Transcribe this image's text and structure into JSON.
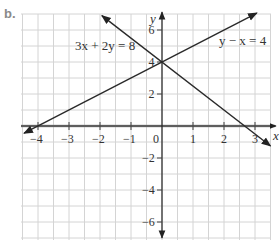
{
  "part_label": "b.",
  "chart_data": {
    "type": "line",
    "title": "",
    "xlabel": "x",
    "ylabel": "y",
    "xlim": [
      -4.5,
      3.5
    ],
    "ylim": [
      -7,
      7
    ],
    "grid": true,
    "x_ticks": [
      -4,
      -3,
      -2,
      -1,
      0,
      1,
      2,
      3
    ],
    "x_tick_labels": [
      "−4",
      "−3",
      "−2",
      "−1",
      "0",
      "1",
      "2",
      "3"
    ],
    "y_ticks": [
      6,
      4,
      2,
      -2,
      -4,
      -6
    ],
    "y_tick_labels": [
      "6",
      "4",
      "2",
      "−2",
      "−4",
      "−6"
    ],
    "series": [
      {
        "name": "3x + 2y = 8",
        "equation": "y = 4 - 1.5x",
        "x": [
          -1.94,
          0,
          2.667,
          3.5
        ],
        "y": [
          6.9,
          4,
          0,
          -1.25
        ]
      },
      {
        "name": "y − x = 4",
        "equation": "y = x + 4",
        "x": [
          -4.45,
          -4,
          0,
          3.06
        ],
        "y": [
          -0.45,
          0,
          4,
          7.06
        ]
      }
    ],
    "annotations": [
      {
        "text": "3x + 2y = 8",
        "near": [
          -2.8,
          5
        ]
      },
      {
        "text": "y − x = 4",
        "near": [
          2.5,
          5.3
        ]
      }
    ],
    "intersection": [
      0,
      4
    ]
  },
  "labels": {
    "line1": "3x + 2y = 8",
    "line2": "y − x = 4",
    "x_axis": "x",
    "y_axis": "y"
  }
}
